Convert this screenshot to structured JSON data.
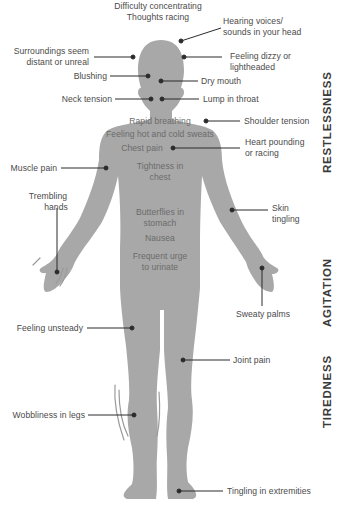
{
  "colors": {
    "body_fill": "#a8a8a8",
    "leader_line": "#2b2b2b",
    "label_text": "#4a4a4a",
    "inner_label_text": "#6b6b6b",
    "tremor_marks": "#9a9a9a",
    "background": "#ffffff"
  },
  "sections": {
    "restlessness": "RESTLESSNESS",
    "agitation": "AGITATION",
    "tiredness": "TIREDNESS"
  },
  "labels": {
    "difficulty_concentrating": "Difficulty concentrating",
    "thoughts_racing": "Thoughts racing",
    "hearing_voices_1": "Hearing voices/",
    "hearing_voices_2": "sounds in your head",
    "surroundings_1": "Surroundings seem",
    "surroundings_2": "distant or unreal",
    "dizzy_1": "Feeling dizzy or",
    "dizzy_2": "lightheaded",
    "blushing": "Blushing",
    "dry_mouth": "Dry mouth",
    "neck_tension": "Neck tension",
    "lump_in_throat": "Lump in throat",
    "rapid_breathing": "Rapid breathing",
    "shoulder_tension": "Shoulder tension",
    "hot_cold_sweats": "Feeling hot and cold sweats",
    "chest_pain": "Chest pain",
    "heart_pounding_1": "Heart pounding",
    "heart_pounding_2": "or racing",
    "muscle_pain": "Muscle pain",
    "tightness_1": "Tightness in",
    "tightness_2": "chest",
    "trembling_1": "Trembling",
    "trembling_2": "hands",
    "butterflies_1": "Butterflies in",
    "butterflies_2": "stomach",
    "skin_tingling_1": "Skin",
    "skin_tingling_2": "tingling",
    "nausea": "Nausea",
    "urinate_1": "Frequent urge",
    "urinate_2": "to urinate",
    "sweaty_palms": "Sweaty palms",
    "feeling_unsteady": "Feeling unsteady",
    "joint_pain": "Joint pain",
    "wobbliness": "Wobbliness in legs",
    "tingling_extremities": "Tingling in extremities"
  }
}
